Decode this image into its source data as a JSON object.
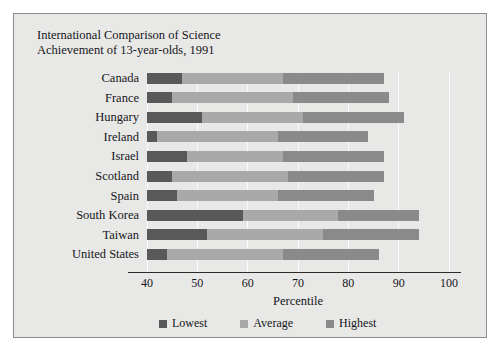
{
  "chart_data": {
    "type": "bar",
    "orientation": "horizontal",
    "stacked": false,
    "title": "International Comparison of Science\nAchievement of 13-year-olds, 1991",
    "xlabel": "Percentile",
    "ylabel": "",
    "xlim": [
      40,
      100
    ],
    "xticks": [
      40,
      50,
      60,
      70,
      80,
      90,
      100
    ],
    "xtick_labels": [
      "40",
      "50",
      "60",
      "70",
      "80",
      "90",
      "100"
    ],
    "grid": true,
    "legend_position": "bottom",
    "categories": [
      "Canada",
      "France",
      "Hungary",
      "Ireland",
      "Israel",
      "Scotland",
      "Spain",
      "South Korea",
      "Taiwan",
      "United States"
    ],
    "series": [
      {
        "name": "Lowest",
        "color": "#595959",
        "values": [
          47,
          45,
          51,
          42,
          48,
          45,
          46,
          59,
          52,
          44
        ]
      },
      {
        "name": "Average",
        "color": "#a9a9a9",
        "values": [
          67,
          69,
          71,
          66,
          67,
          68,
          66,
          78,
          75,
          67
        ]
      },
      {
        "name": "Highest",
        "color": "#8a8a8a",
        "values": [
          87,
          88,
          91,
          84,
          87,
          87,
          85,
          94,
          94,
          86
        ]
      }
    ]
  },
  "legend": {
    "items": [
      {
        "label": "Lowest",
        "color": "#595959"
      },
      {
        "label": "Average",
        "color": "#a9a9a9"
      },
      {
        "label": "Highest",
        "color": "#8a8a8a"
      }
    ]
  }
}
